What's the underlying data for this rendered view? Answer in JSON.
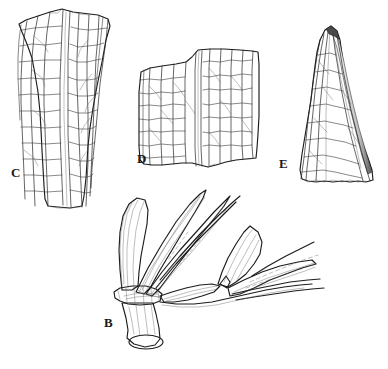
{
  "figure": {
    "kind": "botanical-line-illustration",
    "background_color": "#ffffff",
    "ink_color": "#1c1c1c",
    "width_px": 388,
    "height_px": 369,
    "panel_count": 4
  },
  "panels": [
    {
      "id": "C",
      "label": "C",
      "label_position": {
        "x": 11,
        "y": 166
      },
      "subject": "leaf-sheath-fragment-tapering",
      "description": "Elongate tapering leaf sheath fragment with strong longitudinal veins and irregular cross-venation; widest at top, narrowing downward.",
      "bbox": {
        "x": 18,
        "y": 8,
        "width": 96,
        "height": 202
      }
    },
    {
      "id": "D",
      "label": "D",
      "label_position": {
        "x": 137,
        "y": 152
      },
      "subject": "leaf-blade-fragment-rectangular",
      "description": "Roughly rectangular leaf blade fragment with parallel longitudinal veins and dense transverse cross-veins; torn upper and lower margins.",
      "bbox": {
        "x": 136,
        "y": 48,
        "width": 126,
        "height": 122
      }
    },
    {
      "id": "E",
      "label": "E",
      "label_position": {
        "x": 279,
        "y": 157
      },
      "subject": "leaf-apex-acute",
      "description": "Acute leaf apex, narrowly triangular with a darkened folded margin along the right edge and converging longitudinal veins.",
      "bbox": {
        "x": 289,
        "y": 24,
        "width": 88,
        "height": 160
      }
    },
    {
      "id": "B",
      "label": "B",
      "label_position": {
        "x": 104,
        "y": 316
      },
      "subject": "sheath-node-with-blades",
      "description": "Cylindrical sheath base at a node with several strap-shaped blades diverging upward and to the right; ligule visible at the junction.",
      "bbox": {
        "x": 108,
        "y": 190,
        "width": 200,
        "height": 160
      }
    }
  ],
  "labels": {
    "C": "C",
    "D": "D",
    "E": "E",
    "B": "B"
  },
  "colors": {
    "background": "#ffffff",
    "outline_ink": "#1c1c1c",
    "vein_ink": "#2a2a2a",
    "cross_vein_ink": "#3a3a3a",
    "stipple_ink": "#5a5a5a",
    "label_text": "#1a1a1a"
  }
}
